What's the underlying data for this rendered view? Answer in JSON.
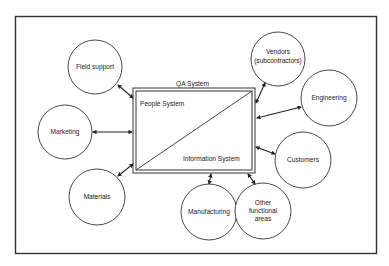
{
  "diagram": {
    "qa_system_label": "QA System",
    "people_system_label": "People System",
    "information_system_label": "Information System",
    "nodes": [
      {
        "id": "field-support",
        "lines": [
          "Field support"
        ]
      },
      {
        "id": "marketing",
        "lines": [
          "Marketing"
        ]
      },
      {
        "id": "materials",
        "lines": [
          "Materials"
        ]
      },
      {
        "id": "manufacturing",
        "lines": [
          "Manufacturing"
        ]
      },
      {
        "id": "other-functional-areas",
        "lines": [
          "Other",
          "functional",
          "areas"
        ]
      },
      {
        "id": "customers",
        "lines": [
          "Customers"
        ]
      },
      {
        "id": "engineering",
        "lines": [
          "Engineering"
        ]
      },
      {
        "id": "vendors",
        "lines": [
          "Vendors",
          "(subcontractors)"
        ]
      }
    ]
  }
}
